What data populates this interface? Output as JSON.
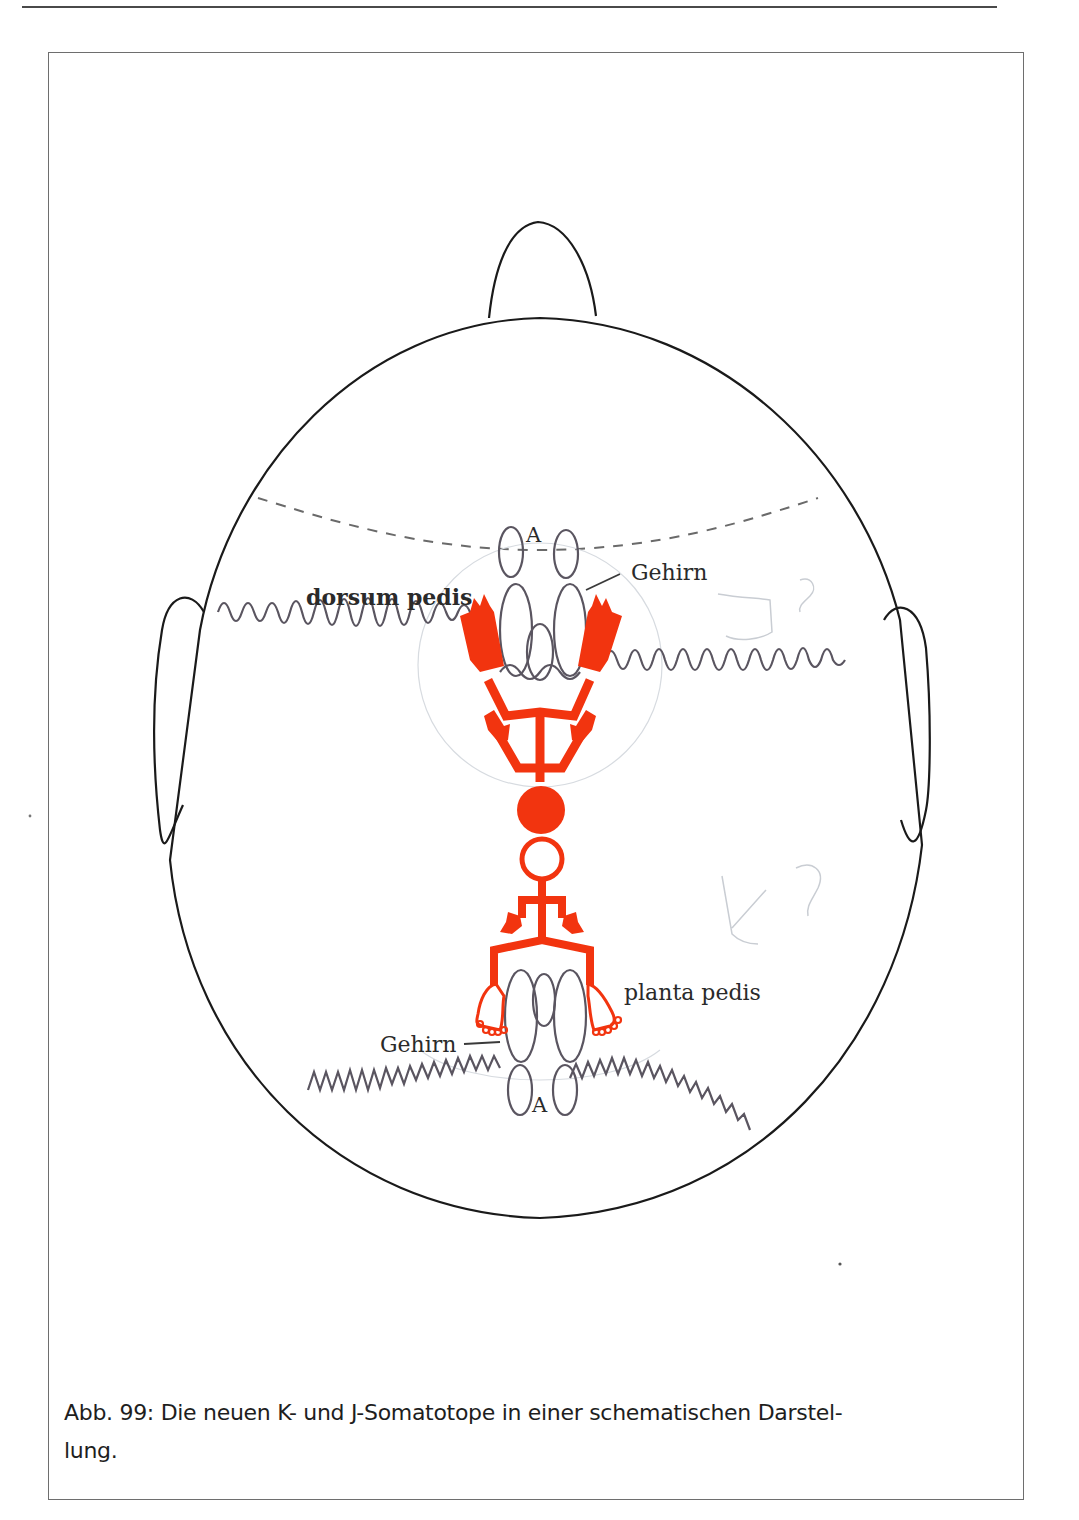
{
  "page": {
    "header_rule": true
  },
  "figure": {
    "type": "schematic-diagram",
    "colors": {
      "outline": "#1a1a1a",
      "brain_lines": "#5a5560",
      "somatotope_red": "#f2340f",
      "dashed_line": "#6a6a6a",
      "pencil_marks": "#c9cdd3"
    },
    "labels": {
      "upper_a": "A",
      "upper_gehirn": "Gehirn",
      "dorsum_pedis": "dorsum pedis",
      "planta_pedis": "planta pedis",
      "lower_gehirn": "Gehirn",
      "lower_a": "A"
    },
    "pencil_annotations": {
      "upper_right": "J?",
      "lower_right": "K?"
    }
  },
  "caption": {
    "text": "Abb. 99: Die neuen K- und J-Somatotope in einer schematischen Darstel-",
    "text_line2": "lung."
  }
}
